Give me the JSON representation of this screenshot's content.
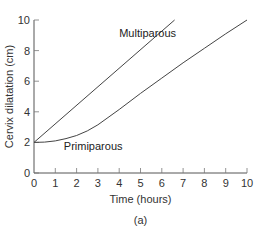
{
  "figure": {
    "caption": "(a)"
  },
  "chart_data": {
    "type": "line",
    "title": "",
    "xlabel": "Time (hours)",
    "ylabel": "Cervix dilatation (cm)",
    "xlim": [
      0,
      10
    ],
    "ylim": [
      0,
      10
    ],
    "xticks": [
      "0",
      "1",
      "2",
      "3",
      "4",
      "5",
      "6",
      "7",
      "8",
      "9",
      "10"
    ],
    "yticks": [
      "0",
      "2",
      "4",
      "6",
      "8",
      "10"
    ],
    "grid": false,
    "legend": "none",
    "annotations": [
      {
        "text": "Multiparous",
        "x": 4.0,
        "y": 8.9
      },
      {
        "text": "Primiparous",
        "x": 1.4,
        "y": 1.5
      }
    ],
    "series": [
      {
        "name": "Multiparous",
        "x": [
          0,
          6.6
        ],
        "y": [
          2,
          10
        ]
      },
      {
        "name": "Primiparous",
        "x": [
          0,
          0.5,
          1,
          1.5,
          2,
          2.5,
          3,
          4,
          5,
          6,
          7,
          8,
          9,
          10
        ],
        "y": [
          2,
          2.02,
          2.1,
          2.25,
          2.45,
          2.75,
          3.15,
          4.15,
          5.2,
          6.2,
          7.2,
          8.15,
          9.1,
          10
        ]
      }
    ]
  }
}
